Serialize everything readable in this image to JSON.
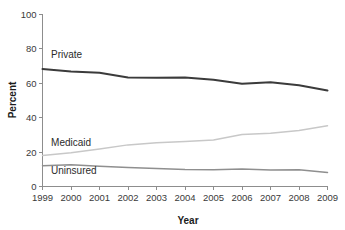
{
  "chart_data": {
    "type": "line",
    "title": "",
    "xlabel": "Year",
    "ylabel": "Percent",
    "x": [
      1999,
      2000,
      2001,
      2002,
      2003,
      2004,
      2005,
      2006,
      2007,
      2008,
      2009
    ],
    "categories": [
      "1999",
      "2000",
      "2001",
      "2002",
      "2003",
      "2004",
      "2005",
      "2006",
      "2007",
      "2008",
      "2009"
    ],
    "xlim": [
      1999,
      2009
    ],
    "ylim": [
      0,
      100
    ],
    "yticks": [
      0,
      20,
      40,
      60,
      80,
      100
    ],
    "ytick_labels": [
      "0",
      "20",
      "40",
      "60",
      "80",
      "100"
    ],
    "xtick_labels": [
      "1999",
      "2000",
      "2001",
      "2002",
      "2003",
      "2004",
      "2005",
      "2006",
      "2007",
      "2008",
      "2009"
    ],
    "grid": false,
    "legend": "inline-labels",
    "series": [
      {
        "name": "Private",
        "label": "Private",
        "color": "#3b3b3b",
        "width": 2.0,
        "values": [
          68.3,
          66.8,
          66.2,
          63.4,
          63.2,
          63.4,
          62.0,
          59.7,
          60.6,
          58.9,
          55.8
        ]
      },
      {
        "name": "Medicaid",
        "label": "Medicaid",
        "color": "#c8c8c8",
        "width": 1.5,
        "values": [
          18.0,
          19.6,
          21.8,
          24.2,
          25.4,
          26.1,
          27.0,
          30.2,
          30.9,
          32.6,
          35.3
        ]
      },
      {
        "name": "Uninsured",
        "label": "Uninsured",
        "color": "#8f8f8f",
        "width": 1.5,
        "values": [
          12.1,
          12.6,
          11.8,
          11.1,
          10.4,
          9.9,
          9.8,
          10.2,
          9.6,
          9.8,
          8.2
        ]
      }
    ],
    "annotations": [
      {
        "text": "Private",
        "series": "Private",
        "x": 1999.3,
        "y": 74.5
      },
      {
        "text": "Medicaid",
        "series": "Medicaid",
        "x": 1999.3,
        "y": 23.5
      },
      {
        "text": "Uninsured",
        "series": "Uninsured",
        "x": 1999.3,
        "y": 7.0
      }
    ]
  },
  "axes": {
    "y_title": "Percent",
    "x_title": "Year",
    "axis_color": "#8d8d8d"
  }
}
